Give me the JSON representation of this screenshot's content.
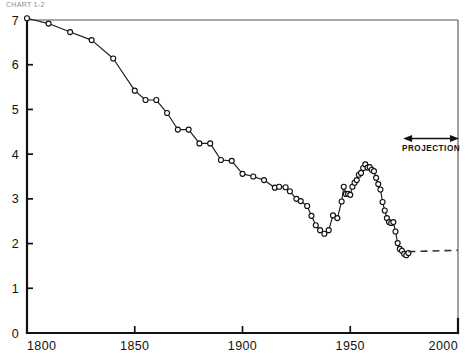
{
  "header": {
    "caption": "CHART 1-2"
  },
  "annotations": {
    "projection_label": "PROJECTION"
  },
  "chart_data": {
    "type": "line",
    "title": "",
    "subtitle": "",
    "xlabel": "",
    "ylabel": "",
    "xlim": [
      1800,
      2000
    ],
    "ylim": [
      0,
      7
    ],
    "xticks": [
      1800,
      1850,
      1900,
      1950,
      2000
    ],
    "xtick_labels": [
      "1800",
      "1850",
      "1900",
      "1950",
      "2000"
    ],
    "yticks": [
      0,
      1,
      2,
      3,
      4,
      5,
      6,
      7
    ],
    "ytick_labels": [
      "0",
      "1",
      "2",
      "3",
      "4",
      "5",
      "6",
      "7"
    ],
    "grid": false,
    "legend": "none",
    "marker": "open-circle",
    "line_color": "#1a1a1a",
    "marker_fill": "#ffffff",
    "series": [
      {
        "name": "Total fertility rate",
        "x": [
          1800,
          1810,
          1820,
          1830,
          1840,
          1850,
          1855,
          1860,
          1865,
          1870,
          1875,
          1880,
          1885,
          1890,
          1895,
          1900,
          1905,
          1910,
          1915,
          1917,
          1920,
          1922,
          1925,
          1927,
          1930,
          1932,
          1934,
          1936,
          1938,
          1940,
          1942,
          1944,
          1946,
          1947,
          1948,
          1949,
          1950,
          1951,
          1952,
          1953,
          1954,
          1955,
          1956,
          1957,
          1958,
          1959,
          1960,
          1961,
          1962,
          1963,
          1964,
          1965,
          1966,
          1967,
          1968,
          1969,
          1970,
          1971,
          1972,
          1973,
          1974,
          1975,
          1976,
          1977
        ],
        "y": [
          7.04,
          6.92,
          6.73,
          6.55,
          6.14,
          5.42,
          5.21,
          5.21,
          4.92,
          4.55,
          4.55,
          4.24,
          4.24,
          3.87,
          3.85,
          3.56,
          3.5,
          3.42,
          3.25,
          3.27,
          3.26,
          3.17,
          3.0,
          2.95,
          2.84,
          2.62,
          2.41,
          2.3,
          2.22,
          2.3,
          2.63,
          2.57,
          2.94,
          3.27,
          3.11,
          3.11,
          3.09,
          3.27,
          3.36,
          3.42,
          3.54,
          3.58,
          3.69,
          3.77,
          3.7,
          3.71,
          3.65,
          3.62,
          3.47,
          3.33,
          3.21,
          2.93,
          2.74,
          2.57,
          2.48,
          2.46,
          2.48,
          2.27,
          2.01,
          1.88,
          1.84,
          1.77,
          1.74,
          1.79
        ]
      }
    ],
    "projection": {
      "style": "dashed",
      "x": [
        1977,
        2000
      ],
      "y": [
        1.82,
        1.85
      ],
      "label": "PROJECTION",
      "arrow_span_x": [
        1975,
        2000
      ],
      "arrow_y_value": 4.35
    }
  }
}
